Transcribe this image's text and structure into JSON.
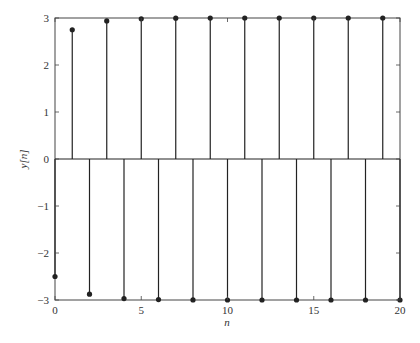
{
  "chart_data": {
    "type": "stem",
    "title": "",
    "xlabel": "n",
    "ylabel": "y[n]",
    "xlim": [
      0,
      20
    ],
    "ylim": [
      -3,
      3
    ],
    "xticks": [
      0,
      5,
      10,
      15,
      20
    ],
    "yticks": [
      -3,
      -2,
      -1,
      0,
      1,
      2,
      3
    ],
    "xtick_labels": [
      "0",
      "5",
      "10",
      "15",
      "20"
    ],
    "ytick_labels": [
      "−3",
      "−2",
      "−1",
      "0",
      "1",
      "2",
      "3"
    ],
    "grid": false,
    "legend": null,
    "x": [
      0,
      1,
      2,
      3,
      4,
      5,
      6,
      7,
      8,
      9,
      10,
      11,
      12,
      13,
      14,
      15,
      16,
      17,
      18,
      19,
      20
    ],
    "values": [
      -2.5,
      2.75,
      -2.875,
      2.9375,
      -2.969,
      2.984,
      -2.992,
      2.996,
      -2.998,
      2.999,
      -3.0,
      3.0,
      -3.0,
      3.0,
      -3.0,
      3.0,
      -3.0,
      3.0,
      -3.0,
      3.0,
      -3.0
    ]
  },
  "colors": {
    "stem": "#222222",
    "axis": "#444444",
    "text": "#333333"
  }
}
